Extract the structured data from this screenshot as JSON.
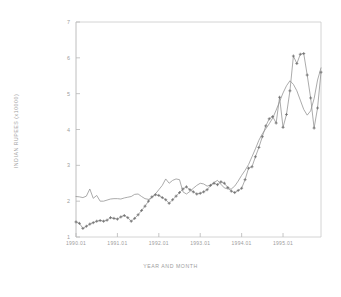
{
  "chart_data": {
    "type": "line",
    "title": "",
    "xlabel": "YEAR AND MONTH",
    "ylabel": "INDIAN RUPEES (x10000)",
    "ylim": [
      1,
      7
    ],
    "yticks": [
      1,
      2,
      3,
      4,
      5,
      6,
      7
    ],
    "ytick_labels": [
      "1",
      "2",
      "3",
      "4",
      "5",
      "6",
      "7"
    ],
    "xlim": [
      0,
      71
    ],
    "xticks": [
      0,
      12,
      24,
      36,
      48,
      60
    ],
    "xtick_labels": [
      "1990.01",
      "1991.01",
      "1992.01",
      "1993.01",
      "1994.01",
      "1995.01"
    ],
    "grid": false,
    "legend": "none",
    "frame_color": "#b5b5b5",
    "line_color": "#8f8f8f",
    "marker_color": "#6f6f6f",
    "x": [
      0,
      1,
      2,
      3,
      4,
      5,
      6,
      7,
      8,
      9,
      10,
      11,
      12,
      13,
      14,
      15,
      16,
      17,
      18,
      19,
      20,
      21,
      22,
      23,
      24,
      25,
      26,
      27,
      28,
      29,
      30,
      31,
      32,
      33,
      34,
      35,
      36,
      37,
      38,
      39,
      40,
      41,
      42,
      43,
      44,
      45,
      46,
      47,
      48,
      49,
      50,
      51,
      52,
      53,
      54,
      55,
      56,
      57,
      58,
      59,
      60,
      61,
      62,
      63,
      64,
      65,
      66,
      67,
      68,
      69,
      70,
      71
    ],
    "series": [
      {
        "name": "smooth-line",
        "marker": "none",
        "values": [
          2.13,
          2.12,
          2.1,
          2.14,
          2.34,
          2.08,
          2.16,
          2.0,
          2.0,
          2.03,
          2.06,
          2.07,
          2.07,
          2.06,
          2.09,
          2.11,
          2.13,
          2.19,
          2.2,
          2.13,
          2.07,
          2.05,
          2.1,
          2.2,
          2.32,
          2.44,
          2.62,
          2.5,
          2.58,
          2.62,
          2.6,
          2.26,
          2.2,
          2.27,
          2.36,
          2.44,
          2.5,
          2.48,
          2.42,
          2.45,
          2.52,
          2.58,
          2.47,
          2.37,
          2.34,
          2.34,
          2.42,
          2.56,
          2.72,
          2.86,
          3.02,
          3.24,
          3.46,
          3.7,
          3.88,
          4.02,
          4.16,
          4.32,
          4.54,
          4.78,
          5.02,
          5.22,
          5.36,
          5.26,
          5.08,
          4.82,
          4.56,
          4.4,
          4.52,
          4.86,
          5.38,
          5.72
        ]
      },
      {
        "name": "observed-plus-markers",
        "marker": "+",
        "values": [
          1.42,
          1.38,
          1.24,
          1.3,
          1.36,
          1.4,
          1.44,
          1.46,
          1.44,
          1.47,
          1.54,
          1.52,
          1.5,
          1.56,
          1.6,
          1.54,
          1.44,
          1.52,
          1.62,
          1.74,
          1.86,
          2.0,
          2.12,
          2.18,
          2.16,
          2.1,
          2.04,
          1.94,
          2.04,
          2.14,
          2.24,
          2.34,
          2.4,
          2.32,
          2.26,
          2.2,
          2.22,
          2.26,
          2.32,
          2.44,
          2.5,
          2.46,
          2.54,
          2.5,
          2.38,
          2.28,
          2.24,
          2.3,
          2.36,
          2.6,
          2.92,
          2.96,
          3.24,
          3.5,
          3.8,
          4.1,
          4.3,
          4.36,
          4.18,
          4.9,
          4.06,
          4.42,
          5.08,
          6.05,
          5.84,
          6.1,
          6.12,
          5.52,
          4.88,
          4.04,
          4.6,
          5.6
        ]
      }
    ]
  }
}
